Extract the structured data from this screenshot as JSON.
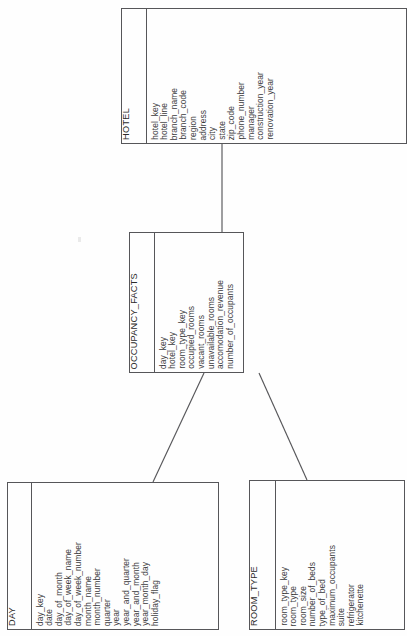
{
  "diagram": {
    "type": "star-schema-er-diagram",
    "entities": [
      {
        "id": "hotel",
        "name": "HOTEL",
        "attributes": [
          "hotel_key",
          "hotel_line",
          "branch_name",
          "branch_code",
          "region",
          "address",
          "city",
          "state",
          "zip_code",
          "phone_number",
          "manager",
          "construction_year",
          "renovation_year"
        ]
      },
      {
        "id": "occupancy_facts",
        "name": "OCCUPANCY_FACTS",
        "attributes": [
          "day_key",
          "hotel_key",
          "room_type_key",
          "occupied_rooms",
          "vacant_rooms",
          "unavailable_rooms",
          "accomodation_revenue",
          "number_of_occupants"
        ]
      },
      {
        "id": "day",
        "name": "DAY",
        "attributes": [
          "day_key",
          "date",
          "day_of_month",
          "day_of_week_name",
          "day_of_week_number",
          "month_name",
          "month_number",
          "quarter",
          "year",
          "year_and_quarter",
          "year_and_month",
          "year_month_day",
          "holiday_flag"
        ]
      },
      {
        "id": "room_type",
        "name": "ROOM_TYPE",
        "attributes": [
          "room_type_key",
          "room_type",
          "room_size",
          "number_of_beds",
          "type_of_bed",
          "maximum_occupants",
          "suite",
          "refrigerator",
          "kitchenette"
        ]
      }
    ],
    "relationships": [
      {
        "id": "hotel-occupancy",
        "from": "hotel",
        "to": "occupancy_facts"
      },
      {
        "id": "occupancy-day",
        "from": "occupancy_facts",
        "to": "day"
      },
      {
        "id": "occupancy-room-type",
        "from": "occupancy_facts",
        "to": "room_type"
      }
    ],
    "colors": {
      "line": "#565659",
      "text": "#2b2b2b",
      "background": "#fefefe"
    }
  }
}
